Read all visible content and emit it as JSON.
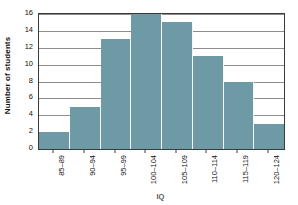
{
  "chart_data": {
    "type": "bar",
    "title": "",
    "xlabel": "IQ",
    "ylabel": "Number of students",
    "categories": [
      "85–89",
      "90–94",
      "95–99",
      "100–104",
      "105–109",
      "110–114",
      "115–119",
      "120–124"
    ],
    "values": [
      2,
      5,
      13,
      16,
      15,
      11,
      8,
      3
    ],
    "ylim": [
      0,
      16
    ],
    "yticks": [
      0,
      2,
      4,
      6,
      8,
      10,
      12,
      14,
      16
    ],
    "ytick_labels": [
      "0",
      "2",
      "4",
      "6",
      "8",
      "10",
      "12",
      "14",
      "16"
    ],
    "grid": "horizontal",
    "legend": null,
    "bar_color": "#6d9aa5",
    "axis_color": "#3a3a3a",
    "gridline_color": "#8d8d8d",
    "background": "#ffffff"
  }
}
